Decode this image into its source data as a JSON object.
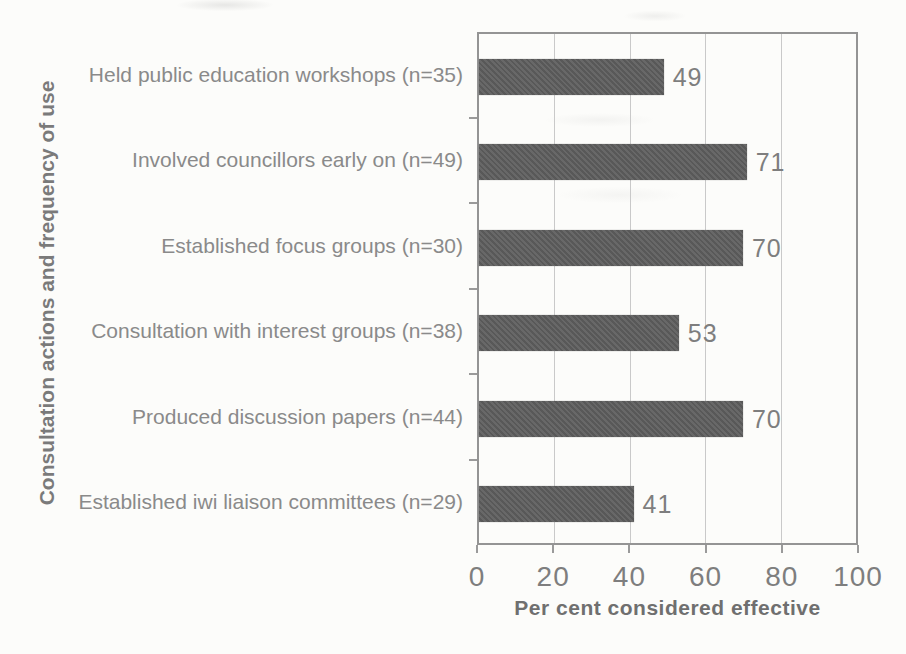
{
  "chart_data": {
    "type": "bar",
    "orientation": "horizontal",
    "categories": [
      "Held public education workshops (n=35)",
      "Involved councillors early on (n=49)",
      "Established focus groups (n=30)",
      "Consultation with interest groups (n=38)",
      "Produced discussion papers (n=44)",
      "Established iwi liaison committees (n=29)"
    ],
    "values": [
      49,
      71,
      70,
      53,
      70,
      41
    ],
    "xlabel": "Per cent considered effective",
    "ylabel": "Consultation actions and frequency of use",
    "xlim": [
      0,
      100
    ],
    "xticks": [
      0,
      20,
      40,
      60,
      80,
      100
    ],
    "grid": true,
    "legend": false,
    "bar_color": "#5f5f5f",
    "gridline_color": "#c9c9c9",
    "axis_color": "#949494",
    "category_label_color": "#8a8a8a",
    "value_label_color": "#7e7e7e"
  }
}
